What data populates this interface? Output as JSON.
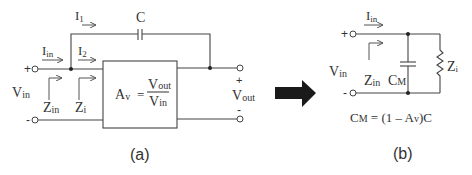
{
  "figure": {
    "panel_a": {
      "caption": "(a)",
      "labels": {
        "i1": "I",
        "i1_sub": "1",
        "i2": "I",
        "i2_sub": "2",
        "iin": "I",
        "iin_sub": "in",
        "capacitor": "C",
        "vin": "V",
        "vin_sub": "in",
        "zin": "Z",
        "zin_sub": "in",
        "zi": "Z",
        "zi_sub": "i",
        "vout": "V",
        "vout_sub": "out",
        "plus_in": "+",
        "minus_in": "-",
        "plus_out": "+",
        "minus_out": "-"
      },
      "amplifier_box": {
        "gain_symbol": "A",
        "gain_sub": "v",
        "equals": "=",
        "numerator": "V",
        "numerator_sub": "out",
        "denominator": "V",
        "denominator_sub": "in"
      }
    },
    "transform_arrow": "right-arrow",
    "panel_b": {
      "caption": "(b)",
      "labels": {
        "iin": "I",
        "iin_sub": "in",
        "vin": "V",
        "vin_sub": "in",
        "zin": "Z",
        "zin_sub": "in",
        "cm": "C",
        "cm_sub": "M",
        "zi": "Z",
        "zi_sub": "i",
        "plus_in": "+",
        "minus_in": "-"
      },
      "formula": {
        "lhs": "C",
        "lhs_sub": "M",
        "rhs_a": " = (1 – A",
        "rhs_sub": "v",
        "rhs_b": ")C"
      }
    }
  }
}
